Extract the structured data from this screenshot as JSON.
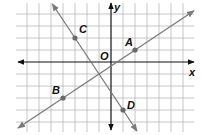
{
  "diagram": {
    "type": "coordinate-plane",
    "x_range": [
      -8,
      7
    ],
    "y_range": [
      -5,
      5
    ],
    "axis_labels": {
      "x": "x",
      "y": "y",
      "origin": "O"
    },
    "points": [
      {
        "id": "A",
        "label": "A",
        "x": 2,
        "y": 1
      },
      {
        "id": "B",
        "label": "B",
        "x": -4,
        "y": -3
      },
      {
        "id": "C",
        "label": "C",
        "x": -3,
        "y": 2
      },
      {
        "id": "D",
        "label": "D",
        "x": 1,
        "y": -4
      }
    ],
    "lines": [
      {
        "id": "line-AB",
        "through": [
          "B",
          "A"
        ],
        "slope": 0.6667,
        "arrows": "both"
      },
      {
        "id": "line-CD",
        "through": [
          "C",
          "D"
        ],
        "slope": -1.5,
        "arrows": "both"
      }
    ],
    "colors": {
      "grid": "#b8b8b8",
      "axes": "#111111",
      "lines": "#7a7a7a",
      "points": "#6a6a6a"
    }
  }
}
